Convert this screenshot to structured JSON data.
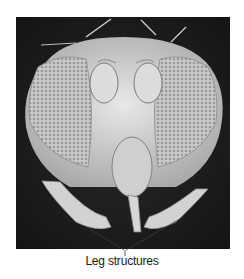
{
  "figure": {
    "label": "Leg structures",
    "colors": {
      "background": "#1c1c1c",
      "specimen": "#d8d8d8",
      "leader_line": "#3a3a3a"
    }
  }
}
